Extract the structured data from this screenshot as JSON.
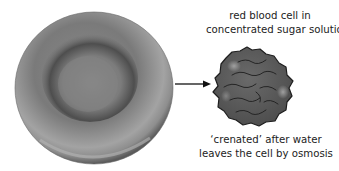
{
  "diagram": {
    "normal_cell": {
      "name": "red blood cell (normal, biconcave)",
      "color": "#7d7d7d"
    },
    "arrow": {
      "direction": "right"
    },
    "crenated_cell": {
      "name": "crenated red blood cell",
      "color": "#5c5c5c"
    },
    "top_label": {
      "line1": "red blood cell in",
      "line2": "concentrated sugar solution"
    },
    "bottom_label": {
      "line1": "‘crenated’ after water",
      "line2": "leaves the cell by osmosis"
    }
  }
}
